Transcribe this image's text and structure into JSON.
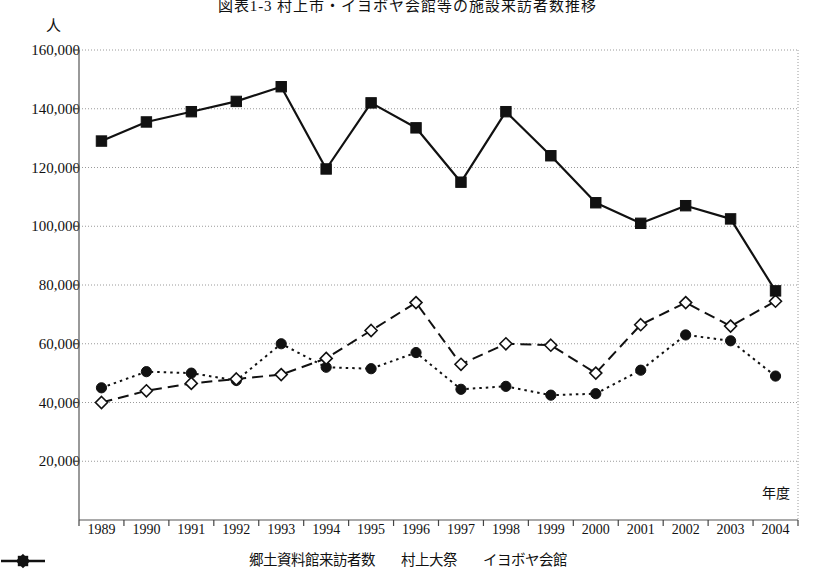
{
  "figure": {
    "title": "図表1-3 村上市・イヨボヤ会館等の施設来訪者数推移",
    "y_unit_label": "人",
    "x_unit_label": "年度"
  },
  "legend": {
    "position": "bottom-center",
    "items": [
      {
        "label": "郷土資料館来訪者数",
        "marker": "filled-circle",
        "line": "dotted",
        "color": "#111111"
      },
      {
        "label": "村上大祭",
        "marker": "open-diamond",
        "line": "dashed",
        "color": "#111111"
      },
      {
        "label": "イヨボヤ会館",
        "marker": "filled-square",
        "line": "solid",
        "color": "#111111"
      }
    ]
  },
  "axes": {
    "y_ticks": [
      "160,000",
      "140,000",
      "120,000",
      "100,000",
      "80,000",
      "60,000",
      "40,000",
      "20,000"
    ],
    "y_tick_values": [
      160000,
      140000,
      120000,
      100000,
      80000,
      60000,
      40000,
      20000
    ],
    "x_ticks": [
      "1989",
      "1990",
      "1991",
      "1992",
      "1993",
      "1994",
      "1995",
      "1996",
      "1997",
      "1998",
      "1999",
      "2000",
      "2001",
      "2002",
      "2003",
      "2004"
    ]
  },
  "chart_data": {
    "type": "line",
    "title": "図表1-3 村上市・イヨボヤ会館等の施設来訪者数推移",
    "xlabel": "年度",
    "ylabel": "人",
    "ylim": [
      0,
      160000
    ],
    "ytick_step": 20000,
    "grid": true,
    "legend_position": "bottom-center",
    "categories": [
      "1989",
      "1990",
      "1991",
      "1992",
      "1993",
      "1994",
      "1995",
      "1996",
      "1997",
      "1998",
      "1999",
      "2000",
      "2001",
      "2002",
      "2003",
      "2004"
    ],
    "series": [
      {
        "name": "郷土資料館来訪者数",
        "marker": "filled-circle",
        "line": "dotted",
        "color": "#111111",
        "values": [
          45000,
          50500,
          50000,
          47500,
          60000,
          52000,
          51500,
          57000,
          44500,
          45500,
          42500,
          43000,
          51000,
          63000,
          61000,
          49000
        ]
      },
      {
        "name": "村上大祭",
        "marker": "open-diamond",
        "line": "dashed",
        "color": "#111111",
        "values": [
          40000,
          44000,
          46500,
          48000,
          49500,
          55000,
          64500,
          74000,
          53000,
          60000,
          59500,
          50000,
          66500,
          74000,
          66000,
          74500
        ]
      },
      {
        "name": "イヨボヤ会館",
        "marker": "filled-square",
        "line": "solid",
        "color": "#111111",
        "values": [
          129000,
          135500,
          139000,
          142500,
          147500,
          119500,
          142000,
          133500,
          115000,
          139000,
          124000,
          108000,
          101000,
          107000,
          102500,
          78000
        ]
      }
    ]
  }
}
